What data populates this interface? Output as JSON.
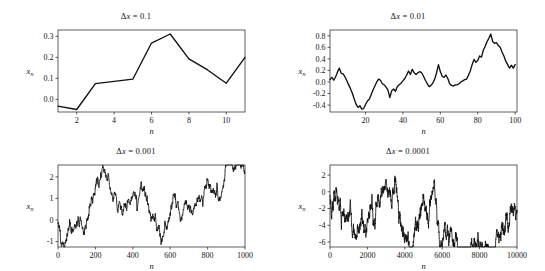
{
  "figure": {
    "name": "random-walk-step-size-grid",
    "background": "#ffffff",
    "line_color": "#111111",
    "axis_color": "#1a1a1a",
    "rows": 2,
    "cols": 2
  },
  "chart_data": [
    {
      "type": "line",
      "panel": "top-left",
      "title": "Δx = 0.1",
      "title_symbol": "Δ",
      "title_var": "x",
      "title_value": "0.1",
      "xlabel": "n",
      "ylabel": "x_n",
      "ylabel_base": "x",
      "ylabel_sub": "n",
      "xlim": [
        1,
        11
      ],
      "ylim": [
        -0.06,
        0.33
      ],
      "xticks": [
        2,
        4,
        6,
        8,
        10
      ],
      "yticks": [
        0.0,
        0.1,
        0.2,
        0.3
      ],
      "ytick_labels": [
        "0.0",
        "0.1",
        "0.2",
        "0.3"
      ],
      "xtick_labels": [
        "2",
        "4",
        "6",
        "8",
        "10"
      ],
      "grid": false,
      "legend": "none",
      "x": [
        1,
        2,
        3,
        4,
        5,
        6,
        7,
        8,
        9,
        10,
        11
      ],
      "values": [
        -0.032,
        -0.048,
        0.075,
        0.086,
        0.096,
        0.268,
        0.311,
        0.193,
        0.14,
        0.077,
        0.2
      ]
    },
    {
      "type": "line",
      "panel": "top-right",
      "title": "Δx = 0.01",
      "title_symbol": "Δ",
      "title_var": "x",
      "title_value": "0.01",
      "xlabel": "n",
      "ylabel": "x_n",
      "ylabel_base": "x",
      "ylabel_sub": "n",
      "xlim": [
        1,
        101
      ],
      "ylim": [
        -0.52,
        0.9
      ],
      "xticks": [
        0,
        20,
        40,
        60,
        80,
        100
      ],
      "yticks": [
        -0.4,
        -0.2,
        0.0,
        0.2,
        0.4,
        0.6,
        0.8
      ],
      "ytick_labels": [
        "-0.4",
        "-0.2",
        "0.0",
        "0.2",
        "0.4",
        "0.6",
        "0.8"
      ],
      "xtick_labels": [
        "0",
        "20",
        "40",
        "60",
        "80",
        "100"
      ],
      "grid": false,
      "legend": "none",
      "x": [
        1,
        2,
        3,
        4,
        5,
        6,
        7,
        8,
        9,
        10,
        11,
        12,
        13,
        14,
        15,
        16,
        17,
        18,
        19,
        20,
        21,
        22,
        23,
        24,
        25,
        26,
        27,
        28,
        29,
        30,
        31,
        32,
        33,
        34,
        35,
        36,
        37,
        38,
        39,
        40,
        41,
        42,
        43,
        44,
        45,
        46,
        47,
        48,
        49,
        50,
        51,
        52,
        53,
        54,
        55,
        56,
        57,
        58,
        59,
        60,
        61,
        62,
        63,
        64,
        65,
        66,
        67,
        68,
        69,
        70,
        71,
        72,
        73,
        74,
        75,
        76,
        77,
        78,
        79,
        80,
        81,
        82,
        83,
        84,
        85,
        86,
        87,
        88,
        89,
        90,
        91,
        92,
        93,
        94,
        95,
        96,
        97,
        98,
        99,
        100,
        101
      ],
      "values": [
        0.04,
        0.08,
        0.03,
        0.09,
        0.17,
        0.24,
        0.15,
        0.14,
        0.09,
        0.02,
        -0.05,
        -0.12,
        -0.2,
        -0.3,
        -0.39,
        -0.44,
        -0.41,
        -0.47,
        -0.46,
        -0.39,
        -0.33,
        -0.3,
        -0.22,
        -0.14,
        -0.07,
        0.0,
        0.05,
        0.03,
        -0.03,
        -0.05,
        -0.09,
        -0.14,
        -0.27,
        -0.15,
        -0.12,
        -0.16,
        -0.08,
        -0.05,
        -0.02,
        0.02,
        0.06,
        0.12,
        0.19,
        0.13,
        0.22,
        0.16,
        0.13,
        0.16,
        0.18,
        0.16,
        0.1,
        0.03,
        -0.03,
        -0.08,
        -0.06,
        -0.02,
        0.05,
        0.16,
        0.3,
        0.18,
        0.1,
        0.08,
        0.12,
        0.06,
        -0.03,
        -0.06,
        -0.07,
        -0.05,
        -0.05,
        -0.03,
        0.0,
        0.02,
        0.04,
        0.05,
        0.11,
        0.19,
        0.3,
        0.39,
        0.34,
        0.37,
        0.45,
        0.43,
        0.55,
        0.62,
        0.7,
        0.76,
        0.83,
        0.7,
        0.67,
        0.68,
        0.63,
        0.6,
        0.52,
        0.45,
        0.36,
        0.3,
        0.24,
        0.29,
        0.24,
        0.3
      ]
    },
    {
      "type": "line",
      "panel": "bottom-left",
      "title": "Δx = 0.001",
      "title_symbol": "Δ",
      "title_var": "x",
      "title_value": "0.001",
      "xlabel": "n",
      "ylabel": "x_n",
      "ylabel_base": "x",
      "ylabel_sub": "n",
      "xlim": [
        0,
        1000
      ],
      "ylim": [
        -1.25,
        2.55
      ],
      "xticks": [
        0,
        200,
        400,
        600,
        800,
        1000
      ],
      "yticks": [
        -1,
        0,
        1,
        2
      ],
      "ytick_labels": [
        "-1",
        "0",
        "1",
        "2"
      ],
      "xtick_labels": [
        "0",
        "200",
        "400",
        "600",
        "800",
        "1000"
      ],
      "grid": false,
      "legend": "none",
      "seed": 20240117,
      "walk_params": {
        "n_points": 1001,
        "step_scale": 0.0995,
        "start": -0.12,
        "smoothing": 1
      },
      "anchors_x": [
        0,
        20,
        45,
        70,
        95,
        120,
        145,
        170,
        195,
        220,
        245,
        270,
        295,
        320,
        345,
        370,
        395,
        420,
        445,
        470,
        495,
        520,
        545,
        570,
        595,
        620,
        645,
        670,
        695,
        720,
        745,
        770,
        795,
        820,
        845,
        870,
        895,
        920,
        945,
        970,
        1000
      ],
      "anchors_y": [
        -0.15,
        -0.55,
        -0.72,
        -0.45,
        -0.62,
        -0.5,
        -0.85,
        -0.25,
        0.35,
        0.55,
        1.05,
        0.78,
        0.4,
        0.28,
        0.62,
        1.25,
        0.85,
        1.15,
        1.55,
        0.95,
        0.55,
        -0.35,
        -1.05,
        -0.55,
        0.45,
        0.85,
        1.0,
        0.6,
        0.5,
        0.05,
        0.5,
        1.3,
        1.75,
        1.2,
        0.7,
        1.45,
        1.9,
        2.4,
        2.05,
        2.45,
        2.2
      ]
    },
    {
      "type": "line",
      "panel": "bottom-right",
      "title": "Δx = 0.0001",
      "title_symbol": "Δ",
      "title_var": "x",
      "title_value": "0.0001",
      "xlabel": "n",
      "ylabel": "x_n",
      "ylabel_base": "x",
      "ylabel_sub": "n",
      "xlim": [
        0,
        10000
      ],
      "ylim": [
        -6.6,
        3.2
      ],
      "xticks": [
        0,
        2000,
        4000,
        6000,
        8000,
        10000
      ],
      "yticks": [
        -6,
        -4,
        -2,
        0,
        2
      ],
      "ytick_labels": [
        "-6",
        "-4",
        "-2",
        "0",
        "2"
      ],
      "xtick_labels": [
        "0",
        "2000",
        "4000",
        "6000",
        "8000",
        "10000"
      ],
      "grid": false,
      "legend": "none",
      "seed": 77310294,
      "walk_params": {
        "n_points": 2000,
        "step_scale": 0.285,
        "start": -0.3,
        "smoothing": 1
      },
      "anchors_x": [
        0,
        250,
        500,
        750,
        900,
        1100,
        1350,
        1600,
        1850,
        2100,
        2350,
        2600,
        2850,
        3100,
        3350,
        3600,
        3850,
        4100,
        4350,
        4600,
        4850,
        5000,
        5250,
        5500,
        5750,
        6000,
        6250,
        6500,
        6750,
        7000,
        7250,
        7500,
        7750,
        7900,
        8150,
        8400,
        8650,
        8900,
        9100,
        9350,
        9600,
        9850,
        10000
      ],
      "anchors_y": [
        -0.4,
        -0.85,
        0.7,
        2.0,
        2.9,
        1.1,
        0.35,
        0.9,
        0.25,
        1.0,
        0.05,
        0.75,
        -0.15,
        -1.1,
        -1.8,
        -2.3,
        -3.0,
        -2.35,
        -2.9,
        -2.2,
        -1.0,
        1.1,
        -0.5,
        0.6,
        -1.2,
        -1.6,
        -1.0,
        -1.6,
        -1.1,
        -2.0,
        -3.7,
        -0.2,
        1.6,
        2.0,
        0.3,
        -1.8,
        -2.9,
        -4.5,
        -5.6,
        -3.6,
        -2.3,
        -3.0,
        -2.2
      ]
    }
  ]
}
